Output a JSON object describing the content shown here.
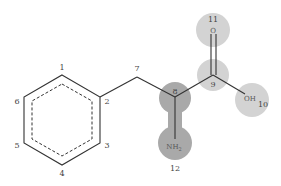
{
  "diagram": {
    "type": "molecular-structure",
    "colors": {
      "highlight_dark": "#a9a9a9",
      "highlight_light": "#d3d3d3",
      "bond": "#333333",
      "label": "#444444"
    },
    "atom_labels": {
      "a1": "1",
      "a2": "2",
      "a3": "3",
      "a4": "4",
      "a5": "5",
      "a6": "6",
      "a7": "7",
      "a8": "8",
      "a9": "9",
      "a10": "10",
      "a11": "11",
      "a12": "12"
    },
    "groups": {
      "carbonyl_o": "O",
      "hydroxyl": "OH",
      "amine": "NH",
      "amine_sub": "2"
    }
  }
}
